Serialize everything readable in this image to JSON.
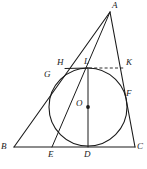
{
  "figure": {
    "caption": "",
    "stroke_color": "#1a1a1a",
    "label_color": "#1a1a1a",
    "background": "#ffffff",
    "width": 147,
    "height": 169
  },
  "labels": {
    "A": "A",
    "B": "B",
    "C": "C",
    "D": "D",
    "E": "E",
    "F": "F",
    "G": "G",
    "H": "H",
    "K": "K",
    "L": "L",
    "O": "O"
  },
  "points": {
    "A": {
      "x": 110,
      "y": 12,
      "label_x": 112,
      "label_y": 2
    },
    "B": {
      "x": 14,
      "y": 147,
      "label_x": 2,
      "label_y": 144
    },
    "C": {
      "x": 135,
      "y": 147,
      "label_x": 137,
      "label_y": 144
    },
    "D": {
      "x": 88,
      "y": 147,
      "label_x": 84,
      "label_y": 151
    },
    "E": {
      "x": 52,
      "y": 147,
      "label_x": 48,
      "label_y": 151
    },
    "F": {
      "x": 123,
      "y": 98,
      "label_x": 126,
      "label_y": 91
    },
    "G": {
      "x": 57,
      "y": 78,
      "label_x": 45,
      "label_y": 72
    },
    "H": {
      "x": 66,
      "y": 68,
      "label_x": 58,
      "label_y": 60
    },
    "K": {
      "x": 125,
      "y": 68,
      "label_x": 127,
      "label_y": 60
    },
    "L": {
      "x": 88,
      "y": 68,
      "label_x": 85,
      "label_y": 59
    },
    "O": {
      "x": 88,
      "y": 107,
      "label_x": 77,
      "label_y": 101
    }
  },
  "circle": {
    "center_x": 88,
    "center_y": 107,
    "radius": 39,
    "name": "incircle"
  },
  "segments": [
    {
      "name": "side-AB",
      "x1": 110,
      "y1": 12,
      "x2": 14,
      "y2": 147,
      "style": "solid"
    },
    {
      "name": "side-AC",
      "x1": 110,
      "y1": 12,
      "x2": 135,
      "y2": 147,
      "style": "solid"
    },
    {
      "name": "side-BC",
      "x1": 14,
      "y1": 147,
      "x2": 135,
      "y2": 147,
      "style": "solid"
    },
    {
      "name": "cevian-AE",
      "x1": 110,
      "y1": 12,
      "x2": 52,
      "y2": 147,
      "style": "solid"
    },
    {
      "name": "diameter-LD",
      "x1": 88,
      "y1": 68,
      "x2": 88,
      "y2": 147,
      "style": "solid"
    },
    {
      "name": "chord-HK-dashed",
      "x1": 88,
      "y1": 68,
      "x2": 124,
      "y2": 68,
      "style": "dashed"
    },
    {
      "name": "chord-HL",
      "x1": 66,
      "y1": 68,
      "x2": 88,
      "y2": 68,
      "style": "solid"
    }
  ]
}
